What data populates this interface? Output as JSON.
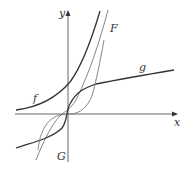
{
  "figure": {
    "axes": {
      "x_label": "x",
      "y_label": "y"
    },
    "curves": [
      {
        "name": "f",
        "label": "f",
        "style": "thin"
      },
      {
        "name": "F",
        "label": "F",
        "style": "thin"
      },
      {
        "name": "g",
        "label": "g",
        "style": "thick"
      },
      {
        "name": "G",
        "label": "G",
        "style": "thin"
      }
    ],
    "colors": {
      "axis": "#555555",
      "thick_curve": "#333333",
      "thin_curve": "#777777",
      "background": "#ffffff"
    }
  }
}
